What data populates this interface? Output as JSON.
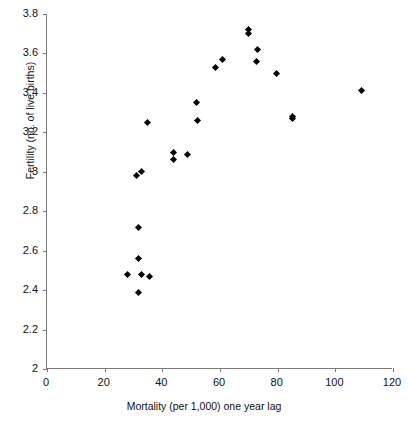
{
  "chart_data": {
    "type": "scatter",
    "title": "",
    "xlabel": "Mortality (per 1,000) one year lag",
    "ylabel": "Fertility (no. of live births)",
    "xlim": [
      0,
      120
    ],
    "ylim": [
      2,
      3.8
    ],
    "xticks": [
      "0",
      "20",
      "40",
      "60",
      "80",
      "100",
      "120"
    ],
    "xtick_values": [
      0,
      20,
      40,
      60,
      80,
      100,
      120
    ],
    "yticks": [
      "2",
      "2.2",
      "2.4",
      "2.6",
      "2.8",
      "3",
      "3.2",
      "3.4",
      "3.6",
      "3.8"
    ],
    "ytick_values": [
      2,
      2.2,
      2.4,
      2.6,
      2.8,
      3,
      3.2,
      3.4,
      3.6,
      3.8
    ],
    "grid": false,
    "legend": null,
    "marker_style": "filled-diamond",
    "marker_color": "#000000",
    "points": [
      {
        "x": 27.9,
        "y": 2.48
      },
      {
        "x": 31.9,
        "y": 2.39
      },
      {
        "x": 32.9,
        "y": 2.48
      },
      {
        "x": 31.9,
        "y": 2.56
      },
      {
        "x": 31.9,
        "y": 2.72
      },
      {
        "x": 35.4,
        "y": 2.47
      },
      {
        "x": 31.2,
        "y": 2.98
      },
      {
        "x": 32.9,
        "y": 3.0
      },
      {
        "x": 34.7,
        "y": 3.25
      },
      {
        "x": 44.0,
        "y": 3.06
      },
      {
        "x": 44.0,
        "y": 3.1
      },
      {
        "x": 48.9,
        "y": 3.09
      },
      {
        "x": 52.3,
        "y": 3.26
      },
      {
        "x": 52.0,
        "y": 3.35
      },
      {
        "x": 58.6,
        "y": 3.53
      },
      {
        "x": 60.7,
        "y": 3.57
      },
      {
        "x": 70.0,
        "y": 3.72
      },
      {
        "x": 70.0,
        "y": 3.7
      },
      {
        "x": 73.1,
        "y": 3.62
      },
      {
        "x": 72.8,
        "y": 3.56
      },
      {
        "x": 79.7,
        "y": 3.5
      },
      {
        "x": 85.2,
        "y": 3.28
      },
      {
        "x": 85.2,
        "y": 3.27
      },
      {
        "x": 109.2,
        "y": 3.41
      }
    ]
  }
}
